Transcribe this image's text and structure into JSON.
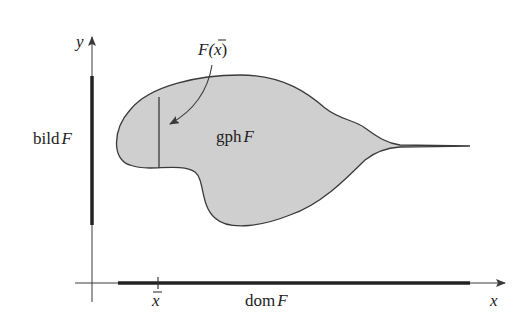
{
  "figure": {
    "colors": {
      "background": "#ffffff",
      "region_fill": "#cfcfcf",
      "stroke": "#3a3a3a",
      "text": "#222222"
    },
    "labels": {
      "y_axis": "y",
      "x_axis": "x",
      "x_bar": "x",
      "image_label_prefix": "bild",
      "image_label_var": "F",
      "graph_label_prefix": "gph",
      "graph_label_var": "F",
      "domain_label_prefix": "dom",
      "domain_label_var": "F",
      "F_xbar_F": "F(",
      "F_xbar_x": "x",
      "F_xbar_close": ")"
    }
  }
}
